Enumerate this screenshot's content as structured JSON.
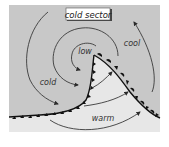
{
  "diagram": {
    "type": "mid-latitude cyclone / frontal system",
    "labels": {
      "header": "cold sector",
      "low": "low",
      "cold": "cold",
      "cool": "cool",
      "warm": "warm"
    },
    "colors": {
      "cold_region": "#c8c8c8",
      "warm_sector": "#e7e7e7",
      "line": "#3a3a3a",
      "front_symbol": "#111111",
      "label_box": "#ffffff"
    },
    "fronts": [
      {
        "name": "cold front",
        "symbol": "triangles"
      },
      {
        "name": "warm/occluded front",
        "symbol": "triangles and semicircles"
      }
    ],
    "airflow_arrows": 7
  }
}
